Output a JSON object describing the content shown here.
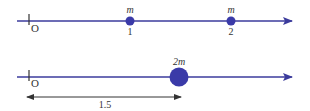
{
  "colors": {
    "axis": "#3b3b9c",
    "mass": "#3a3aa8",
    "dimension": "#333333",
    "text": "#333333"
  },
  "top_axis": {
    "origin_label": "O",
    "masses": [
      {
        "mass_label": "m",
        "position_label": "1"
      },
      {
        "mass_label": "m",
        "position_label": "2"
      }
    ]
  },
  "bottom_axis": {
    "origin_label": "O",
    "mass": {
      "mass_label": "2m"
    },
    "dimension_label": "1.5"
  }
}
